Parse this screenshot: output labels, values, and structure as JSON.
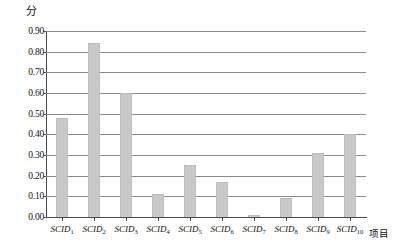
{
  "chart_data": {
    "type": "bar",
    "title": "",
    "subtitle": "",
    "xlabel": "项目",
    "ylabel": "分",
    "categories": [
      "SCID1",
      "SCID2",
      "SCID3",
      "SCID4",
      "SCID5",
      "SCID6",
      "SCID7",
      "SCID8",
      "SCID9",
      "SCID10"
    ],
    "category_labels": [
      {
        "base": "SCID",
        "sub": "1"
      },
      {
        "base": "SCID",
        "sub": "2"
      },
      {
        "base": "SCID",
        "sub": "3"
      },
      {
        "base": "SCID",
        "sub": "4"
      },
      {
        "base": "SCID",
        "sub": "5"
      },
      {
        "base": "SCID",
        "sub": "6"
      },
      {
        "base": "SCID",
        "sub": "7"
      },
      {
        "base": "SCID",
        "sub": "8"
      },
      {
        "base": "SCID",
        "sub": "9"
      },
      {
        "base": "SCID",
        "sub": "10"
      }
    ],
    "values": [
      0.48,
      0.84,
      0.6,
      0.11,
      0.25,
      0.17,
      0.01,
      0.09,
      0.31,
      0.4
    ],
    "ylim": [
      0.0,
      0.9
    ],
    "ytick_values": [
      0.0,
      0.1,
      0.2,
      0.3,
      0.4,
      0.5,
      0.6,
      0.7,
      0.8,
      0.9
    ],
    "ytick_labels": [
      "0.00",
      "0.10",
      "0.20",
      "0.30",
      "0.40",
      "0.50",
      "0.60",
      "0.70",
      "0.80",
      "0.90"
    ],
    "grid": true,
    "legend": false,
    "legend_position": "none",
    "bar_color": "#c9c9c9",
    "gridline_color": "#8c8c8c",
    "axis_color": "#4a4a4a",
    "background_color": "#ffffff"
  }
}
